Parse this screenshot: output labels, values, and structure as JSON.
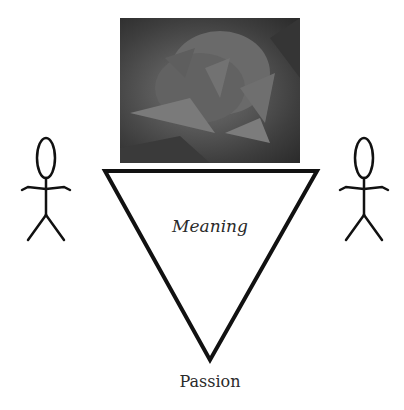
{
  "diagram": {
    "image": {
      "subject": "rose-photo",
      "description": "grayscale photograph of a rose"
    },
    "triangle": {
      "inner_label": "Meaning",
      "bottom_label": "Passion"
    },
    "figures": [
      {
        "name": "left-person",
        "shape": "stick-figure"
      },
      {
        "name": "right-person",
        "shape": "stick-figure"
      }
    ],
    "colors": {
      "stroke": "#111111",
      "text": "#2a2a2a",
      "background": "#ffffff"
    }
  }
}
